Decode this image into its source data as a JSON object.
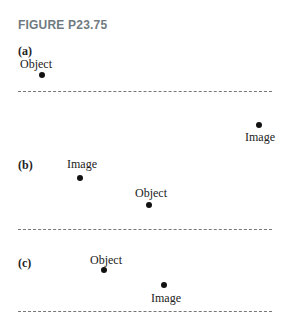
{
  "figure": {
    "title": "FIGURE P23.75",
    "panels": [
      {
        "label": "(a)",
        "object": {
          "text": "Object"
        },
        "image": {
          "text": "Image"
        }
      },
      {
        "label": "(b)",
        "object": {
          "text": "Object"
        },
        "image": {
          "text": "Image"
        }
      },
      {
        "label": "(c)",
        "object": {
          "text": "Object"
        },
        "image": {
          "text": "Image"
        }
      }
    ],
    "mirror_line": "dashed"
  }
}
